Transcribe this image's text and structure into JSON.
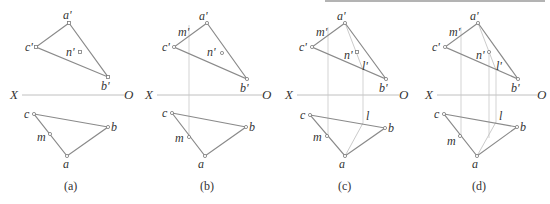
{
  "figure": {
    "axis_labels": {
      "x": "X",
      "o": "O"
    },
    "panels": [
      {
        "caption": "(a)",
        "labels": {
          "a_prime": "a'",
          "b_prime": "b'",
          "c_prime": "c'",
          "n_prime": "n'",
          "a": "a",
          "b": "b",
          "c": "c",
          "m": "m"
        }
      },
      {
        "caption": "(b)",
        "labels": {
          "a_prime": "a'",
          "b_prime": "b'",
          "c_prime": "c'",
          "n_prime": "n'",
          "m_prime": "m'",
          "a": "a",
          "b": "b",
          "c": "c",
          "m": "m"
        }
      },
      {
        "caption": "(c)",
        "labels": {
          "a_prime": "a'",
          "b_prime": "b'",
          "c_prime": "c'",
          "n_prime": "n'",
          "m_prime": "m'",
          "l_prime": "l'",
          "a": "a",
          "b": "b",
          "c": "c",
          "m": "m",
          "l": "l"
        }
      },
      {
        "caption": "(d)",
        "labels": {
          "a_prime": "a'",
          "b_prime": "b'",
          "c_prime": "c'",
          "n_prime": "n'",
          "m_prime": "m'",
          "l_prime": "l'",
          "a": "a",
          "b": "b",
          "c": "c",
          "m": "m",
          "l": "l"
        }
      }
    ]
  }
}
